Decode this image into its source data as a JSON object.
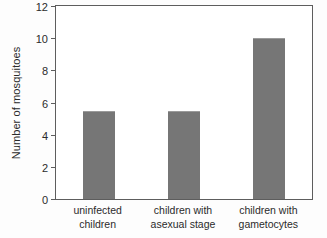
{
  "chart_data": {
    "type": "bar",
    "title": "",
    "xlabel": "",
    "ylabel": "Number of mosquitoes",
    "categories": [
      "uninfected children",
      "children with asexual stage",
      "children with gametocytes"
    ],
    "category_lines": [
      [
        "uninfected",
        "children"
      ],
      [
        "children with",
        "asexual stage"
      ],
      [
        "children with",
        "gametocytes"
      ]
    ],
    "values": [
      5.5,
      5.5,
      10.0
    ],
    "ylim": [
      0,
      12
    ],
    "yticks": [
      0,
      2,
      4,
      6,
      8,
      10,
      12
    ],
    "ytick_labels": [
      "0",
      "2",
      "4",
      "6",
      "8",
      "10",
      "12"
    ],
    "grid": false,
    "legend": null,
    "bar_color": "#767676",
    "axis_color": "#5d5d5d",
    "background_color": "#ffffff"
  }
}
